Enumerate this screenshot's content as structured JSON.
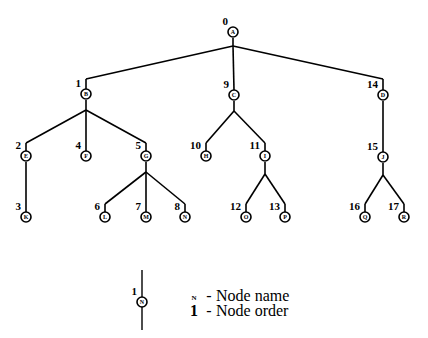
{
  "diagram": {
    "type": "tree",
    "title": "",
    "background_color": "#ffffff",
    "stroke_color": "#000000",
    "nodes": [
      {
        "order": "0",
        "name": "A",
        "x": 233,
        "y": 32,
        "order_x": 228,
        "order_y": 25
      },
      {
        "order": "1",
        "name": "B",
        "x": 86,
        "y": 94,
        "order_x": 81,
        "order_y": 87
      },
      {
        "order": "9",
        "name": "C",
        "x": 234,
        "y": 95,
        "order_x": 229,
        "order_y": 88
      },
      {
        "order": "14",
        "name": "D",
        "x": 383,
        "y": 95,
        "order_x": 378,
        "order_y": 88
      },
      {
        "order": "2",
        "name": "E",
        "x": 26,
        "y": 156,
        "order_x": 21,
        "order_y": 149
      },
      {
        "order": "4",
        "name": "F",
        "x": 86,
        "y": 156,
        "order_x": 81,
        "order_y": 149
      },
      {
        "order": "5",
        "name": "G",
        "x": 146,
        "y": 156,
        "order_x": 141,
        "order_y": 149
      },
      {
        "order": "10",
        "name": "H",
        "x": 206,
        "y": 156,
        "order_x": 201,
        "order_y": 149
      },
      {
        "order": "11",
        "name": "I",
        "x": 265,
        "y": 156,
        "order_x": 260,
        "order_y": 149
      },
      {
        "order": "15",
        "name": "J",
        "x": 383,
        "y": 157,
        "order_x": 378,
        "order_y": 150
      },
      {
        "order": "3",
        "name": "K",
        "x": 26,
        "y": 217,
        "order_x": 21,
        "order_y": 210
      },
      {
        "order": "6",
        "name": "L",
        "x": 105,
        "y": 217,
        "order_x": 100,
        "order_y": 210
      },
      {
        "order": "7",
        "name": "M",
        "x": 146,
        "y": 217,
        "order_x": 141,
        "order_y": 210
      },
      {
        "order": "8",
        "name": "N",
        "x": 185,
        "y": 217,
        "order_x": 180,
        "order_y": 210
      },
      {
        "order": "12",
        "name": "O",
        "x": 246,
        "y": 217,
        "order_x": 241,
        "order_y": 210
      },
      {
        "order": "13",
        "name": "P",
        "x": 285,
        "y": 217,
        "order_x": 280,
        "order_y": 210
      },
      {
        "order": "16",
        "name": "Q",
        "x": 365,
        "y": 217,
        "order_x": 360,
        "order_y": 210
      },
      {
        "order": "17",
        "name": "R",
        "x": 404,
        "y": 217,
        "order_x": 399,
        "order_y": 210
      }
    ],
    "edges": [
      {
        "from": "A",
        "to": "B"
      },
      {
        "from": "A",
        "to": "C"
      },
      {
        "from": "A",
        "to": "D"
      },
      {
        "from": "B",
        "to": "E"
      },
      {
        "from": "B",
        "to": "F"
      },
      {
        "from": "B",
        "to": "G"
      },
      {
        "from": "C",
        "to": "H"
      },
      {
        "from": "C",
        "to": "I"
      },
      {
        "from": "D",
        "to": "J"
      },
      {
        "from": "E",
        "to": "K"
      },
      {
        "from": "G",
        "to": "L"
      },
      {
        "from": "G",
        "to": "M"
      },
      {
        "from": "G",
        "to": "N"
      },
      {
        "from": "I",
        "to": "O"
      },
      {
        "from": "I",
        "to": "P"
      },
      {
        "from": "J",
        "to": "Q"
      },
      {
        "from": "J",
        "to": "R"
      }
    ],
    "node_radius": 5
  },
  "legend": {
    "sample_node": {
      "order": "1",
      "name": "N",
      "x": 142,
      "y": 302,
      "line_top": 270,
      "line_bottom": 330
    },
    "rows": [
      {
        "key": "N",
        "dash": "-",
        "description": "Node name",
        "key_style": "small"
      },
      {
        "key": "1",
        "dash": "-",
        "description": "Node order",
        "key_style": "normal"
      }
    ]
  }
}
